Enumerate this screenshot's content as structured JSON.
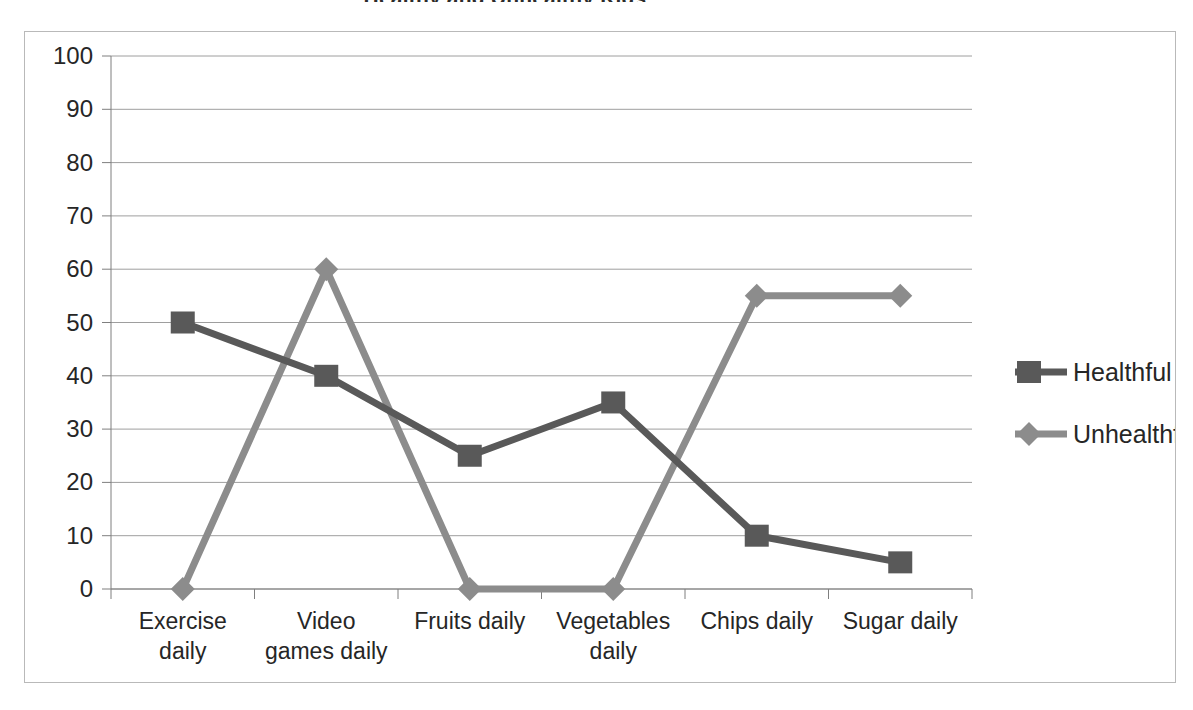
{
  "chart_data": {
    "type": "line",
    "title": "Healthy and Unhealthy Kids",
    "xlabel": "",
    "ylabel": "",
    "ylim": [
      0,
      100
    ],
    "ytick_step": 10,
    "yticks": [
      "0",
      "10",
      "20",
      "30",
      "40",
      "50",
      "60",
      "70",
      "80",
      "90",
      "100"
    ],
    "grid": "horizontal",
    "legend_position": "right",
    "categories": [
      "Exercise daily",
      "Video games daily",
      "Fruits daily",
      "Vegetables daily",
      "Chips daily",
      "Sugar daily"
    ],
    "category_lines": [
      [
        "Exercise",
        "daily"
      ],
      [
        "Video",
        "games daily"
      ],
      [
        "Fruits daily",
        ""
      ],
      [
        "Vegetables",
        "daily"
      ],
      [
        "Chips daily",
        ""
      ],
      [
        "Sugar daily",
        ""
      ]
    ],
    "series": [
      {
        "name": "Healthful",
        "color": "#595959",
        "marker": "square",
        "values": [
          50,
          40,
          25,
          35,
          10,
          5
        ]
      },
      {
        "name": "Unhealthful",
        "color": "#8c8c8c",
        "marker": "diamond",
        "values": [
          0,
          60,
          0,
          0,
          55,
          55
        ]
      }
    ]
  },
  "legend": {
    "items": [
      {
        "label": "Healthful",
        "color": "#595959"
      },
      {
        "label": "Unhealthful",
        "color": "#8c8c8c"
      }
    ]
  },
  "colors": {
    "frame": "#b9b9b9",
    "gridline": "#9e9e9e",
    "axis": "#7f7f7f",
    "text": "#262626",
    "background": "#ffffff"
  }
}
